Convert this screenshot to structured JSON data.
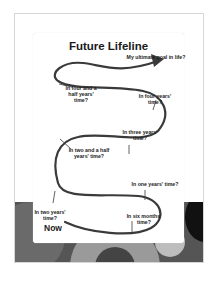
{
  "worksheet": {
    "title": "Future Lifeline",
    "start_label": "Now",
    "milestones": [
      "My ultimate goal in life?",
      "In four and a half years' time?",
      "In four years' time?",
      "In three years' time?",
      "In two and a half years' time?",
      "In one years' time?",
      "In two years' time?",
      "In six months' time?"
    ]
  },
  "colors": {
    "path": "#3a3a3a",
    "background_band": "#555555"
  }
}
